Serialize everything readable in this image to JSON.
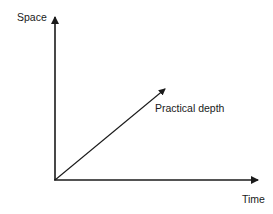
{
  "diagram": {
    "type": "axes-with-vector",
    "axes": {
      "y_label": "Space",
      "x_label": "Time"
    },
    "vector": {
      "label": "Practical depth"
    },
    "colors": {
      "stroke": "#1a1a1a",
      "background": "#ffffff"
    }
  }
}
